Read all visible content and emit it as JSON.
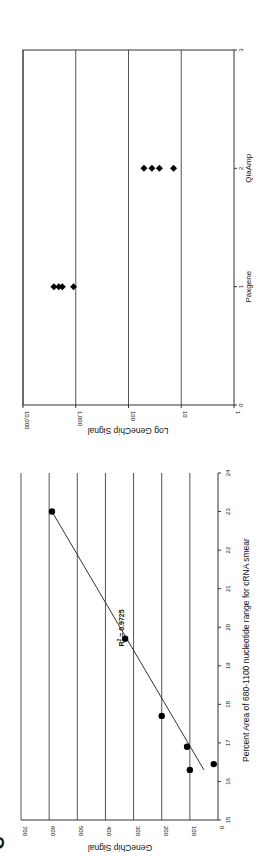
{
  "figure": {
    "panel_letter": "C",
    "rotation": "90deg-ccw"
  },
  "chart_data": [
    {
      "type": "scatter",
      "title": "",
      "xlabel": "Percent Area of 680-1100 nucleotide range for cRNA smear",
      "ylabel": "GeneChip Signal",
      "xlim": [
        15,
        24
      ],
      "ylim": [
        0,
        700
      ],
      "x_ticks": [
        "15",
        "16",
        "17",
        "18",
        "19",
        "20",
        "21",
        "22",
        "23",
        "24"
      ],
      "y_ticks": [
        "0",
        "100",
        "200",
        "300",
        "400",
        "500",
        "600",
        "700"
      ],
      "grid": "horizontal",
      "annotation": "R² = 0.9725",
      "r2_label": "R",
      "r2_sup": "2",
      "r2_value": " = 0.9725",
      "trendline": {
        "type": "linear",
        "x": [
          16.3,
          23.0
        ],
        "y": [
          50,
          590
        ]
      },
      "points": [
        {
          "x": 16.3,
          "y": 100
        },
        {
          "x": 16.45,
          "y": 15
        },
        {
          "x": 16.9,
          "y": 110
        },
        {
          "x": 17.7,
          "y": 200
        },
        {
          "x": 19.7,
          "y": 330
        },
        {
          "x": 23.0,
          "y": 590
        }
      ]
    },
    {
      "type": "scatter",
      "title": "",
      "xlabel": "",
      "ylabel": "Log GeneChip Signal",
      "xlim": [
        0,
        3
      ],
      "ylim": [
        1,
        10000
      ],
      "yscale": "log",
      "x_ticks": [
        "0",
        "1",
        "2",
        "3"
      ],
      "y_ticks": [
        "1",
        "10",
        "100",
        "1,000",
        "10,000"
      ],
      "categories": [
        "Paxgene",
        "QiaAmp"
      ],
      "grid": "horizontal",
      "series": [
        {
          "name": "Paxgene",
          "x": 1,
          "values": [
            2600,
            2100,
            1800,
            1100
          ]
        },
        {
          "name": "QiaAmp",
          "x": 2,
          "values": [
            51,
            36,
            26,
            14
          ]
        }
      ]
    }
  ]
}
